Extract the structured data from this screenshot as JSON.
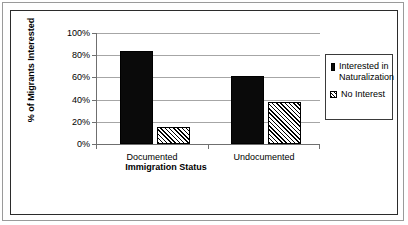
{
  "chart_data": {
    "type": "bar",
    "title": "",
    "subtitle": "",
    "xlabel": "Immigration Status",
    "ylabel": "% of Migrants Interested",
    "categories": [
      "Documented",
      "Undocumented"
    ],
    "series": [
      {
        "name": "Interested in Naturalization",
        "values": [
          84,
          61
        ],
        "style": "solid-black"
      },
      {
        "name": "No Interest",
        "values": [
          15,
          38
        ],
        "style": "diagonal-hatch"
      }
    ],
    "ylim": [
      0,
      100
    ],
    "ytick_labels": [
      "0%",
      "20%",
      "40%",
      "60%",
      "80%",
      "100%"
    ],
    "ytick_values": [
      0,
      20,
      40,
      60,
      80,
      100
    ],
    "grid": "horizontal",
    "legend_position": "right",
    "annotations": []
  },
  "axes": {
    "y_title": "% of Migrants Interested",
    "x_title": "Immigration Status",
    "y_ticks": [
      {
        "label": "100%",
        "value": 100
      },
      {
        "label": "80%",
        "value": 80
      },
      {
        "label": "60%",
        "value": 60
      },
      {
        "label": "40%",
        "value": 40
      },
      {
        "label": "20%",
        "value": 20
      },
      {
        "label": "0%",
        "value": 0
      }
    ],
    "x_categories": [
      {
        "label": "Documented"
      },
      {
        "label": "Undocumented"
      }
    ]
  },
  "legend": {
    "entries": [
      {
        "label": "Interested in Naturalization",
        "swatch": "solid-black-square-icon"
      },
      {
        "label": "No Interest",
        "swatch": "hatched-square-icon"
      }
    ]
  },
  "colors": {
    "series_1": "#0a0a0a",
    "series_2_outline": "#000000",
    "gridline": "#a6a6a6",
    "axis": "#6f6f6f",
    "frame_outer": "#9a9a9a",
    "frame_inner": "#2b2b2b",
    "background": "#ffffff"
  }
}
